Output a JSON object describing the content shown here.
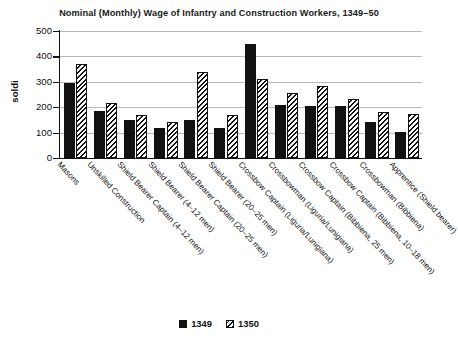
{
  "chart_data": {
    "type": "bar",
    "title": "Nominal (Monthly) Wage of Infantry and Construction Workers, 1349–50",
    "xlabel": "",
    "ylabel": "soldi",
    "ylim": [
      0,
      500
    ],
    "ytick_step": 100,
    "yticks": [
      "500",
      "400",
      "300",
      "200",
      "100",
      "0"
    ],
    "grid": true,
    "legend_position": "bottom",
    "categories": [
      "Masons",
      "Unskilled Construction",
      "Shield Bearer Captain (4–12 men)",
      "Shield Bearer (4–12 men)",
      "Shield Bearer Captain (20–25 men)",
      "Shield Bearer (20–25 men)",
      "Crossbow Captain (Liguria/Lunigiana)",
      "Crossbowman (Liguria/Lunigiana)",
      "Crossbow Captain (Bibbiena, 25 men)",
      "Crossbow Captain (Bibbiena, 10–18 men)",
      "Crossbowman (Bibbiena)",
      "Apprentice (Shield bearer)"
    ],
    "series": [
      {
        "name": "1349",
        "color": "#111111",
        "pattern": "solid",
        "values": [
          295,
          185,
          150,
          120,
          150,
          120,
          448,
          207,
          203,
          203,
          140,
          102
        ]
      },
      {
        "name": "1350",
        "color": "#111111",
        "pattern": "diagonal-hatch",
        "values": [
          370,
          218,
          170,
          142,
          340,
          170,
          313,
          257,
          282,
          232,
          182,
          172
        ]
      }
    ]
  },
  "legend": {
    "items": [
      {
        "label": "1349",
        "pattern": "solid"
      },
      {
        "label": "1350",
        "pattern": "hatch"
      }
    ]
  }
}
